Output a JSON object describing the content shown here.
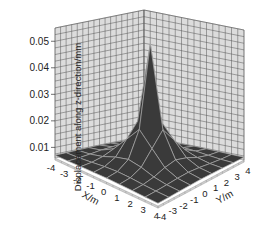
{
  "chart_data": {
    "type": "surface3d",
    "title": "",
    "xlabel": "X/m",
    "ylabel": "Y/m",
    "zlabel": "Displacement along z-direction/mm",
    "x_ticks": [
      "-4",
      "-3",
      "-2",
      "-1",
      "0",
      "1",
      "2",
      "3",
      "4"
    ],
    "y_ticks": [
      "-4",
      "-3",
      "-2",
      "-1",
      "0",
      "1",
      "2",
      "3",
      "4"
    ],
    "z_ticks": [
      "0.01",
      "0.02",
      "0.03",
      "0.04",
      "0.05"
    ],
    "xlim": [
      -4,
      4
    ],
    "ylim": [
      -4,
      4
    ],
    "zlim": [
      0.006,
      0.055
    ],
    "grid": true,
    "grid_x": [
      -4,
      -3,
      -2,
      -1,
      0,
      1,
      2,
      3,
      4
    ],
    "grid_y": [
      -4,
      -3,
      -2,
      -1,
      0,
      1,
      2,
      3,
      4
    ],
    "z_values_note": "Sharp peak at center (0,0) ~0.052 mm decaying to ~0.007 mm at edges",
    "peak": {
      "x": 0,
      "y": 0,
      "z": 0.052
    },
    "base_value": 0.007,
    "colors": {
      "surface": "#3a3a3a",
      "mesh": "#a8a8a8",
      "wall": "#dcdcdc",
      "wall_grid": "#555555",
      "floor_edge": "#cfcfcf"
    }
  }
}
